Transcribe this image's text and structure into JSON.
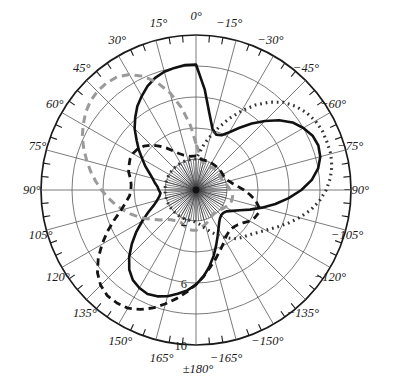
{
  "figure": {
    "type": "polar-radiation-pattern",
    "background_color": "#ffffff",
    "center_px": [
      196,
      190
    ],
    "outer_radius_px": 155
  },
  "axes": {
    "angular_unit": "degrees",
    "angular_direction": "0 deg at top; positive counter-clockwise (left side); negative clockwise (right side)",
    "angular_tick_step": 15,
    "angular_labels": [
      {
        "text": "0°",
        "angle": 0
      },
      {
        "text": "15°",
        "angle": 15
      },
      {
        "text": "30°",
        "angle": 30
      },
      {
        "text": "45°",
        "angle": 45
      },
      {
        "text": "60°",
        "angle": 60
      },
      {
        "text": "75°",
        "angle": 75
      },
      {
        "text": "90°",
        "angle": 90
      },
      {
        "text": "105°",
        "angle": 105
      },
      {
        "text": "120°",
        "angle": 120
      },
      {
        "text": "135°",
        "angle": 135
      },
      {
        "text": "150°",
        "angle": 150
      },
      {
        "text": "165°",
        "angle": 165
      },
      {
        "text": "±180°",
        "angle": 180
      },
      {
        "text": "−165°",
        "angle": -165
      },
      {
        "text": "−150°",
        "angle": -150
      },
      {
        "text": "−135°",
        "angle": -135
      },
      {
        "text": "−120°",
        "angle": -120
      },
      {
        "text": "−105°",
        "angle": -105
      },
      {
        "text": "−90°",
        "angle": -90
      },
      {
        "text": "−75°",
        "angle": -75
      },
      {
        "text": "−60°",
        "angle": -60
      },
      {
        "text": "−45°",
        "angle": -45
      },
      {
        "text": "−30°",
        "angle": -30
      },
      {
        "text": "−15°",
        "angle": -15
      }
    ],
    "radial_rings": [
      2,
      4,
      6,
      8,
      10
    ],
    "radial_max": 10,
    "radial_labels": [
      {
        "text": "2",
        "value": 2
      },
      {
        "text": "6",
        "value": 6
      },
      {
        "text": "10",
        "value": 10
      }
    ]
  },
  "chart_data": {
    "type": "line",
    "title": "",
    "xlabel": "",
    "ylabel": "",
    "polar": true,
    "rlim": [
      0,
      10
    ],
    "grid": true,
    "legend": "none",
    "series": [
      {
        "name": "solid-black-trilobe",
        "style": "solid",
        "color": "#111111",
        "width": 2.6,
        "lobe_peaks_deg": [
          0,
          -110,
          125
        ],
        "theta": [
          0,
          5,
          10,
          15,
          20,
          25,
          30,
          35,
          40,
          45,
          50,
          55,
          60,
          65,
          70,
          75,
          80,
          85,
          90,
          95,
          100,
          105,
          110,
          115,
          120,
          125,
          130,
          135,
          140,
          145,
          150,
          155,
          160,
          165,
          170,
          175,
          180,
          -175,
          -170,
          -165,
          -160,
          -155,
          -150,
          -145,
          -140,
          -135,
          -130,
          -125,
          -120,
          -115,
          -110,
          -105,
          -100,
          -95,
          -90,
          -85,
          -80,
          -75,
          -70,
          -65,
          -60,
          -55,
          -50,
          -45,
          -40,
          -35,
          -30,
          -25,
          -20,
          -15,
          -10,
          -5
        ],
        "r": [
          8.1,
          8.1,
          8.0,
          7.9,
          7.7,
          7.4,
          7.0,
          6.6,
          6.1,
          5.6,
          5.0,
          4.5,
          4.0,
          3.6,
          3.2,
          2.9,
          2.7,
          2.5,
          2.4,
          2.3,
          2.4,
          2.6,
          2.9,
          3.4,
          4.0,
          4.7,
          5.4,
          6.1,
          6.7,
          7.1,
          7.3,
          7.4,
          7.3,
          7.1,
          6.8,
          6.5,
          6.1,
          5.6,
          5.0,
          4.4,
          3.8,
          3.3,
          2.9,
          2.6,
          2.4,
          2.3,
          2.3,
          2.4,
          2.7,
          3.1,
          3.7,
          4.4,
          5.2,
          6.0,
          6.8,
          7.5,
          8.0,
          8.3,
          8.4,
          8.3,
          8.0,
          7.6,
          7.0,
          6.3,
          5.6,
          4.9,
          4.3,
          3.9,
          3.8,
          4.1,
          5.0,
          6.5
        ]
      },
      {
        "name": "gray-dashed-lobe-45",
        "style": "dashed",
        "color": "#9a9a9c",
        "width": 3.0,
        "lobe_peaks_deg": [
          45
        ],
        "theta": [
          0,
          5,
          10,
          15,
          20,
          25,
          30,
          35,
          40,
          45,
          50,
          55,
          60,
          65,
          70,
          75,
          80,
          85,
          90,
          95,
          100,
          105,
          110,
          115,
          120,
          125,
          130,
          135,
          140,
          145,
          150,
          155,
          160,
          165,
          170,
          175,
          180,
          -175,
          -170,
          -165,
          -160,
          -155,
          -150,
          -145,
          -140,
          -135,
          -130,
          -125,
          -120,
          -115,
          -110,
          -105,
          -100,
          -95,
          -90,
          -85,
          -80,
          -75,
          -70,
          -65,
          -60,
          -55,
          -50,
          -45,
          -40,
          -35,
          -30,
          -25,
          -20,
          -15,
          -10,
          -5
        ],
        "r": [
          3.0,
          4.2,
          5.4,
          6.5,
          7.4,
          8.1,
          8.6,
          8.9,
          9.0,
          9.0,
          8.9,
          8.7,
          8.4,
          8.1,
          7.7,
          7.3,
          6.9,
          6.5,
          6.1,
          5.7,
          5.3,
          4.9,
          4.5,
          4.1,
          3.7,
          3.3,
          3.0,
          2.7,
          2.5,
          2.4,
          2.3,
          2.3,
          2.4,
          2.5,
          2.6,
          2.6,
          2.6,
          2.5,
          2.4,
          2.3,
          2.2,
          2.1,
          2.0,
          1.9,
          1.9,
          1.9,
          2.0,
          2.1,
          2.2,
          2.3,
          2.4,
          2.4,
          2.4,
          2.3,
          2.2,
          2.1,
          2.0,
          1.9,
          1.8,
          1.8,
          1.8,
          1.8,
          1.8,
          1.8,
          1.8,
          1.8,
          1.7,
          1.7,
          1.7,
          1.8,
          2.0,
          2.4
        ]
      },
      {
        "name": "black-dashed-lobe-135",
        "style": "dashed",
        "color": "#141414",
        "width": 2.8,
        "lobe_peaks_deg": [
          135
        ],
        "theta": [
          0,
          5,
          10,
          15,
          20,
          25,
          30,
          35,
          40,
          45,
          50,
          55,
          60,
          65,
          70,
          75,
          80,
          85,
          90,
          95,
          100,
          105,
          110,
          115,
          120,
          125,
          130,
          135,
          140,
          145,
          150,
          155,
          160,
          165,
          170,
          175,
          180,
          -175,
          -170,
          -165,
          -160,
          -155,
          -150,
          -145,
          -140,
          -135,
          -130,
          -125,
          -120,
          -115,
          -110,
          -105,
          -100,
          -95,
          -90,
          -85,
          -80,
          -75,
          -70,
          -65,
          -60,
          -55,
          -50,
          -45,
          -40,
          -35,
          -30,
          -25,
          -20,
          -15,
          -10,
          -5
        ],
        "r": [
          2.2,
          2.2,
          2.2,
          2.3,
          2.4,
          2.6,
          2.9,
          3.3,
          3.7,
          4.1,
          4.4,
          4.6,
          4.7,
          4.7,
          4.6,
          4.5,
          4.3,
          4.2,
          4.2,
          4.3,
          4.6,
          5.0,
          5.6,
          6.3,
          7.0,
          7.7,
          8.3,
          8.7,
          8.9,
          8.9,
          8.8,
          8.5,
          8.1,
          7.6,
          7.1,
          6.6,
          6.1,
          5.6,
          5.1,
          4.7,
          4.3,
          4.0,
          3.7,
          3.5,
          3.4,
          3.4,
          3.5,
          3.7,
          4.0,
          4.2,
          4.3,
          4.2,
          3.9,
          3.5,
          3.1,
          2.7,
          2.4,
          2.2,
          2.1,
          2.0,
          2.0,
          2.0,
          2.0,
          2.0,
          2.0,
          2.0,
          2.0,
          2.0,
          2.0,
          2.0,
          2.0,
          2.1
        ]
      },
      {
        "name": "dotted-lobe-minus45",
        "style": "dotted",
        "color": "#333335",
        "width": 3.1,
        "lobe_peaks_deg": [
          -50
        ],
        "theta": [
          0,
          5,
          10,
          15,
          20,
          25,
          30,
          35,
          40,
          45,
          50,
          55,
          60,
          65,
          70,
          75,
          80,
          85,
          90,
          95,
          100,
          105,
          110,
          115,
          120,
          125,
          130,
          135,
          140,
          145,
          150,
          155,
          160,
          165,
          170,
          175,
          180,
          -175,
          -170,
          -165,
          -160,
          -155,
          -150,
          -145,
          -140,
          -135,
          -130,
          -125,
          -120,
          -115,
          -110,
          -105,
          -100,
          -95,
          -90,
          -85,
          -80,
          -75,
          -70,
          -65,
          -60,
          -55,
          -50,
          -45,
          -40,
          -35,
          -30,
          -25,
          -20,
          -15,
          -10,
          -5
        ],
        "r": [
          2.0,
          2.0,
          2.0,
          2.0,
          2.0,
          2.0,
          2.0,
          2.0,
          2.0,
          2.0,
          2.0,
          2.0,
          2.0,
          2.0,
          2.0,
          2.0,
          2.0,
          2.0,
          2.0,
          2.0,
          2.0,
          2.0,
          2.0,
          2.0,
          2.0,
          2.0,
          2.0,
          2.0,
          2.0,
          2.0,
          2.0,
          2.0,
          2.0,
          2.0,
          2.0,
          2.0,
          2.1,
          2.2,
          2.4,
          2.6,
          2.9,
          3.2,
          3.5,
          3.8,
          4.1,
          4.3,
          4.5,
          4.8,
          5.2,
          5.7,
          6.3,
          6.9,
          7.5,
          8.0,
          8.4,
          8.7,
          8.9,
          9.0,
          9.0,
          9.0,
          8.9,
          8.7,
          8.4,
          8.0,
          7.4,
          6.7,
          5.9,
          5.1,
          4.3,
          3.6,
          3.0,
          2.4
        ]
      }
    ]
  }
}
